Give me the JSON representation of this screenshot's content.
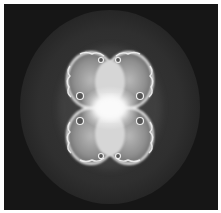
{
  "image": {
    "subject": "grayscale fractal (Julia-set style) with four lobed bulbs around a bright center, inside a dark gray ellipse",
    "colors": {
      "border": "#ffffff",
      "background": "#161616",
      "outer_ellipse": "#2e2e2e",
      "bulb_dark": "#7a7a7a",
      "bulb_mid": "#a8a8a8",
      "bulb_light": "#d4d4d4",
      "bulb_edge": "#f2f2f2",
      "center_glow": "#f5f5f5"
    }
  }
}
